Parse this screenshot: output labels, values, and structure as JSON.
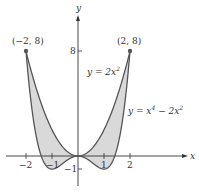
{
  "figure": {
    "axes": {
      "x_label": "x",
      "y_label": "y",
      "x_ticks": [
        {
          "value": -2,
          "label": "−2"
        },
        {
          "value": -1,
          "label": "−1"
        },
        {
          "value": 1,
          "label": "1"
        },
        {
          "value": 2,
          "label": "2"
        }
      ],
      "y_ticks": [
        {
          "value": 8,
          "label": "8"
        },
        {
          "value": -1,
          "label": "−1"
        }
      ]
    },
    "points": [
      {
        "label": "(−2, 8)",
        "x": -2,
        "y": 8
      },
      {
        "label": "(2, 8)",
        "x": 2,
        "y": 8
      }
    ],
    "curves": [
      {
        "label": "y = 2x²",
        "equation": "y = 2x^2"
      },
      {
        "label": "y = x⁴ − 2x²",
        "equation": "y = x^4 - 2x^2"
      }
    ],
    "colors": {
      "curve": "#555555",
      "fill": "#d9d9d9",
      "axis": "#333333",
      "point": "#555555"
    },
    "labels": {
      "curve_upper_prefix": "y = 2x",
      "curve_upper_sup": "2",
      "curve_lower_prefix": "y = x",
      "curve_lower_sup1": "4",
      "curve_lower_mid": " − 2x",
      "curve_lower_sup2": "2",
      "point_left": "(−2, 8)",
      "point_right": "(2, 8)",
      "axis_x": "x",
      "axis_y": "y",
      "tick_x_m2": "−2",
      "tick_x_m1": "−1",
      "tick_x_1": "1",
      "tick_x_2": "2",
      "tick_y_8": "8",
      "tick_y_m1": "−1"
    }
  }
}
